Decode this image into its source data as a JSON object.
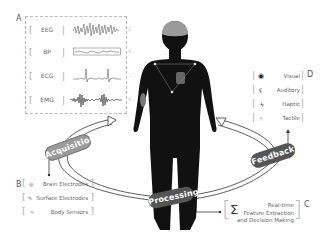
{
  "panels": {
    "A": {
      "label": "A",
      "signals": [
        {
          "name": "EEG",
          "icon": "brain-icon",
          "glyph": "☾"
        },
        {
          "name": "BP",
          "icon": "pressure-icon",
          "glyph": "☾"
        },
        {
          "name": "ECG",
          "icon": "heart-icon",
          "glyph": "♡"
        },
        {
          "name": "EMG",
          "icon": "muscle-icon",
          "glyph": "☾"
        }
      ]
    },
    "B": {
      "label": "B",
      "items": [
        {
          "label": "Brain Electrodes",
          "icon": "brain-electrode-icon",
          "glyph": "◎"
        },
        {
          "label": "Surface Electrodes",
          "icon": "surface-electrode-icon",
          "glyph": "✎"
        },
        {
          "label": "Body Sensors",
          "icon": "body-sensor-icon",
          "glyph": "≈"
        }
      ]
    },
    "C": {
      "label": "C",
      "symbol": "Σ",
      "lines": [
        "Real-time",
        "Feature Extraction",
        "and Decision Making"
      ]
    },
    "D": {
      "label": "D",
      "items": [
        {
          "label": "Visual",
          "icon": "eye-icon",
          "glyph": "◉"
        },
        {
          "label": "Auditory",
          "icon": "ear-icon",
          "glyph": "ʕ"
        },
        {
          "label": "Haptic",
          "icon": "vibration-icon",
          "glyph": "ϟ"
        },
        {
          "label": "Tactile",
          "icon": "hand-icon",
          "glyph": "☝"
        }
      ]
    }
  },
  "cycle": {
    "acquisition": "Acquisition",
    "processing": "Processing",
    "feedback": "Feedback"
  },
  "colors": {
    "body": "#111111",
    "brain": "#9a9a9a",
    "pill_light": "#9a9a9a",
    "pill_dark": "#555555",
    "text": "#666666"
  }
}
